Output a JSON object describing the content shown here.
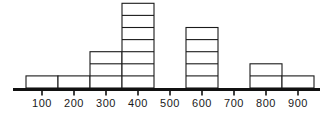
{
  "chart_data": {
    "type": "bar",
    "title": "",
    "subtitle": "",
    "xlabel": "",
    "ylabel": "",
    "categories": [
      "100",
      "200",
      "300",
      "400",
      "500",
      "600",
      "700",
      "800",
      "900"
    ],
    "values": [
      1,
      1,
      3,
      7,
      0,
      5,
      0,
      2,
      1
    ],
    "tick_labels": [
      "100",
      "200",
      "300",
      "400",
      "500",
      "600",
      "700",
      "800",
      "900"
    ],
    "bin_edges": [
      50,
      150,
      250,
      350,
      450,
      550,
      650,
      750,
      850,
      950
    ],
    "xlim": [
      0,
      1000
    ],
    "ylim": [
      0,
      7
    ],
    "grid": false,
    "legend": null,
    "annotations": [],
    "style": {
      "bar_fill": "#ffffff",
      "bar_stroke": "#1a1a1a",
      "axis_color": "#111111",
      "label_color": "#1a1a1a",
      "unit_square_divisions": true
    }
  },
  "axis": {
    "tick_values": [
      "100",
      "200",
      "300",
      "400",
      "500",
      "600",
      "700",
      "800",
      "900"
    ]
  }
}
